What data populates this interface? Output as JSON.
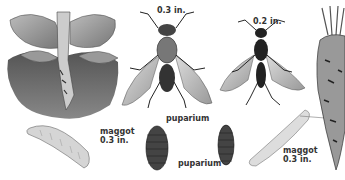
{
  "illustration": {
    "subject": "root maggot fly life stages and damage",
    "labels": {
      "maggot_left": "maggot",
      "maggot_left_size": "0.3 in.",
      "fly_large_size": "0.3 in.",
      "puparium_top": "puparium",
      "puparium_bottom": "puparium",
      "fly_small_size": "0.2 in.",
      "maggot_right": "maggot",
      "maggot_right_size": "0.3 in."
    }
  }
}
